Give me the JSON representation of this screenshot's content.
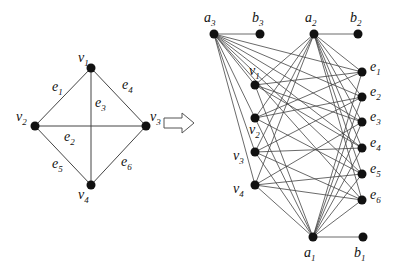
{
  "colors": {
    "edge": "#444444",
    "node": "#111111",
    "arrow": "#555555"
  },
  "left_graph": {
    "nodes": [
      {
        "id": "v1",
        "base": "v",
        "sub": "1",
        "x": 91,
        "y": 68,
        "lx": 78,
        "ly": 62
      },
      {
        "id": "v2",
        "base": "v",
        "sub": "2",
        "x": 35,
        "y": 126,
        "lx": 16,
        "ly": 121
      },
      {
        "id": "v3",
        "base": "v",
        "sub": "3",
        "x": 146,
        "y": 126,
        "lx": 150,
        "ly": 121
      },
      {
        "id": "v4",
        "base": "v",
        "sub": "4",
        "x": 91,
        "y": 185,
        "lx": 78,
        "ly": 199
      }
    ],
    "edges": [
      {
        "id": "e1",
        "from": "v1",
        "to": "v2",
        "base": "e",
        "sub": "1",
        "lx": 52,
        "ly": 91
      },
      {
        "id": "e2",
        "from": "v2",
        "to": "v3",
        "base": "e",
        "sub": "2",
        "lx": 64,
        "ly": 141
      },
      {
        "id": "e3",
        "from": "v1",
        "to": "v4",
        "base": "e",
        "sub": "3",
        "lx": 95,
        "ly": 107
      },
      {
        "id": "e4",
        "from": "v1",
        "to": "v3",
        "base": "e",
        "sub": "4",
        "lx": 122,
        "ly": 89
      },
      {
        "id": "e5",
        "from": "v2",
        "to": "v4",
        "base": "e",
        "sub": "5",
        "lx": 52,
        "ly": 168
      },
      {
        "id": "e6",
        "from": "v3",
        "to": "v4",
        "base": "e",
        "sub": "6",
        "lx": 121,
        "ly": 166
      }
    ]
  },
  "arrow": {
    "x": 164,
    "y": 113,
    "label": "transforms-to"
  },
  "right_graph": {
    "nodes": [
      {
        "id": "a3",
        "base": "a",
        "sub": "3",
        "x": 214,
        "y": 34,
        "lx": 204,
        "ly": 22
      },
      {
        "id": "b3",
        "base": "b",
        "sub": "3",
        "x": 260,
        "y": 34,
        "lx": 252,
        "ly": 22
      },
      {
        "id": "a2",
        "base": "a",
        "sub": "2",
        "x": 314,
        "y": 34,
        "lx": 305,
        "ly": 22
      },
      {
        "id": "b2",
        "base": "b",
        "sub": "2",
        "x": 358,
        "y": 34,
        "lx": 350,
        "ly": 22
      },
      {
        "id": "v1",
        "base": "v",
        "sub": "1",
        "x": 255,
        "y": 85,
        "lx": 249,
        "ly": 75
      },
      {
        "id": "v2",
        "base": "v",
        "sub": "2",
        "x": 255,
        "y": 118,
        "lx": 249,
        "ly": 134
      },
      {
        "id": "v3",
        "base": "v",
        "sub": "3",
        "x": 255,
        "y": 152,
        "lx": 233,
        "ly": 160
      },
      {
        "id": "v4",
        "base": "v",
        "sub": "4",
        "x": 255,
        "y": 185,
        "lx": 233,
        "ly": 193
      },
      {
        "id": "e1",
        "base": "e",
        "sub": "1",
        "x": 362,
        "y": 72,
        "lx": 370,
        "ly": 71
      },
      {
        "id": "e2",
        "base": "e",
        "sub": "2",
        "x": 362,
        "y": 97,
        "lx": 370,
        "ly": 96
      },
      {
        "id": "e3",
        "base": "e",
        "sub": "3",
        "x": 362,
        "y": 122,
        "lx": 370,
        "ly": 121
      },
      {
        "id": "e4",
        "base": "e",
        "sub": "4",
        "x": 362,
        "y": 148,
        "lx": 370,
        "ly": 147
      },
      {
        "id": "e5",
        "base": "e",
        "sub": "5",
        "x": 362,
        "y": 174,
        "lx": 370,
        "ly": 173
      },
      {
        "id": "e6",
        "base": "e",
        "sub": "6",
        "x": 362,
        "y": 200,
        "lx": 370,
        "ly": 199
      },
      {
        "id": "a1",
        "base": "a",
        "sub": "1",
        "x": 313,
        "y": 237,
        "lx": 304,
        "ly": 257
      },
      {
        "id": "b1",
        "base": "b",
        "sub": "1",
        "x": 363,
        "y": 237,
        "lx": 354,
        "ly": 257
      }
    ],
    "edges": [
      [
        "a3",
        "b3"
      ],
      [
        "a2",
        "b2"
      ],
      [
        "a1",
        "b1"
      ],
      [
        "a3",
        "v1"
      ],
      [
        "a3",
        "v2"
      ],
      [
        "a3",
        "v3"
      ],
      [
        "a3",
        "v4"
      ],
      [
        "a3",
        "e1"
      ],
      [
        "a3",
        "e2"
      ],
      [
        "a3",
        "e3"
      ],
      [
        "a3",
        "e4"
      ],
      [
        "a3",
        "e5"
      ],
      [
        "a3",
        "e6"
      ],
      [
        "a2",
        "v1"
      ],
      [
        "a2",
        "v2"
      ],
      [
        "a2",
        "v3"
      ],
      [
        "a2",
        "v4"
      ],
      [
        "a2",
        "e1"
      ],
      [
        "a2",
        "e2"
      ],
      [
        "a2",
        "e3"
      ],
      [
        "a2",
        "e4"
      ],
      [
        "a2",
        "e5"
      ],
      [
        "a2",
        "e6"
      ],
      [
        "a1",
        "v1"
      ],
      [
        "a1",
        "v2"
      ],
      [
        "a1",
        "v3"
      ],
      [
        "a1",
        "v4"
      ],
      [
        "a1",
        "e1"
      ],
      [
        "a1",
        "e2"
      ],
      [
        "a1",
        "e3"
      ],
      [
        "a1",
        "e4"
      ],
      [
        "a1",
        "e5"
      ],
      [
        "a1",
        "e6"
      ],
      [
        "v1",
        "e1"
      ],
      [
        "v2",
        "e1"
      ],
      [
        "v2",
        "e2"
      ],
      [
        "v3",
        "e2"
      ],
      [
        "v1",
        "e3"
      ],
      [
        "v4",
        "e3"
      ],
      [
        "v1",
        "e4"
      ],
      [
        "v3",
        "e4"
      ],
      [
        "v2",
        "e5"
      ],
      [
        "v4",
        "e5"
      ],
      [
        "v3",
        "e6"
      ],
      [
        "v4",
        "e6"
      ]
    ]
  }
}
